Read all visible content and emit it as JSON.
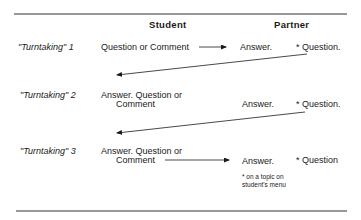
{
  "headers": {
    "student": "Student",
    "partner": "Partner"
  },
  "rows": [
    {
      "label": "\"Turntaking\" 1",
      "student_line1": "Question or Comment",
      "partner_answer": "Answer.",
      "partner_question": "* Question."
    },
    {
      "label": "\"Turntaking\" 2",
      "student_line1": "Answer.  Question or",
      "student_line2": "Comment",
      "partner_answer": "Answer.",
      "partner_question": "* Question."
    },
    {
      "label": "\"Turntaking\" 3",
      "student_line1": "Answer.  Question or",
      "student_line2": "Comment",
      "partner_answer": "Answer.",
      "partner_question": "* Question"
    }
  ],
  "footnote": "* on a topic on student's menu",
  "colors": {
    "ink": "#1a1a1a",
    "rule": "#333333"
  }
}
